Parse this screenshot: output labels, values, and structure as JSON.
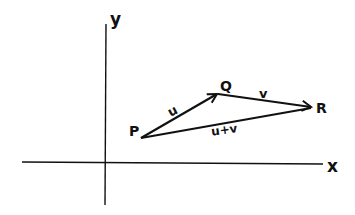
{
  "diagram": {
    "type": "vector-addition",
    "axes": {
      "x_label": "x",
      "y_label": "y"
    },
    "points": {
      "P": {
        "label": "P"
      },
      "Q": {
        "label": "Q"
      },
      "R": {
        "label": "R"
      }
    },
    "vectors": [
      {
        "from": "P",
        "to": "Q",
        "label": "u"
      },
      {
        "from": "Q",
        "to": "R",
        "label": "v"
      },
      {
        "from": "P",
        "to": "R",
        "label": "u+v"
      }
    ],
    "colors": {
      "ink": "#111111",
      "background": "#ffffff"
    }
  }
}
